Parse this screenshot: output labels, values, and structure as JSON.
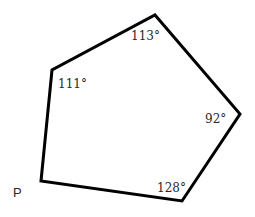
{
  "diagram": {
    "type": "pentagon",
    "stroke_color": "#000000",
    "vertices": [
      {
        "id": "top",
        "x": 155,
        "y": 15
      },
      {
        "id": "right",
        "x": 240,
        "y": 114
      },
      {
        "id": "bottom-right",
        "x": 182,
        "y": 201
      },
      {
        "id": "P",
        "x": 41,
        "y": 181
      },
      {
        "id": "left-upper",
        "x": 52,
        "y": 70
      }
    ],
    "angles": [
      {
        "vertex": "top",
        "label": "113°"
      },
      {
        "vertex": "left-upper",
        "label": "111°"
      },
      {
        "vertex": "right",
        "label": "92°"
      },
      {
        "vertex": "bottom-right",
        "label": "128°"
      }
    ],
    "vertex_labels": [
      {
        "vertex": "P",
        "label": "P"
      }
    ]
  }
}
